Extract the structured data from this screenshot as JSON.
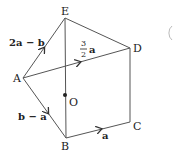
{
  "diagram": {
    "type": "vector-geometry",
    "points": {
      "A": {
        "label": "A",
        "x": 23,
        "y": 78
      },
      "B": {
        "label": "B",
        "x": 66,
        "y": 138
      },
      "C": {
        "label": "C",
        "x": 130,
        "y": 122
      },
      "D": {
        "label": "D",
        "x": 130,
        "y": 48
      },
      "E": {
        "label": "E",
        "x": 65,
        "y": 18
      },
      "O": {
        "label": "O",
        "x": 65,
        "y": 95
      }
    },
    "vectors": [
      {
        "from": "A",
        "to": "E",
        "label": "2a − b"
      },
      {
        "from": "A",
        "to": "D",
        "label_num": "3",
        "label_den": "2",
        "label_vec": "a"
      },
      {
        "from": "A",
        "to": "B",
        "label": "b − a"
      },
      {
        "from": "B",
        "to": "C",
        "label": "a"
      }
    ],
    "segments": [
      [
        "E",
        "D"
      ],
      [
        "D",
        "C"
      ],
      [
        "E",
        "B"
      ]
    ],
    "stroke_color": "#555555"
  }
}
